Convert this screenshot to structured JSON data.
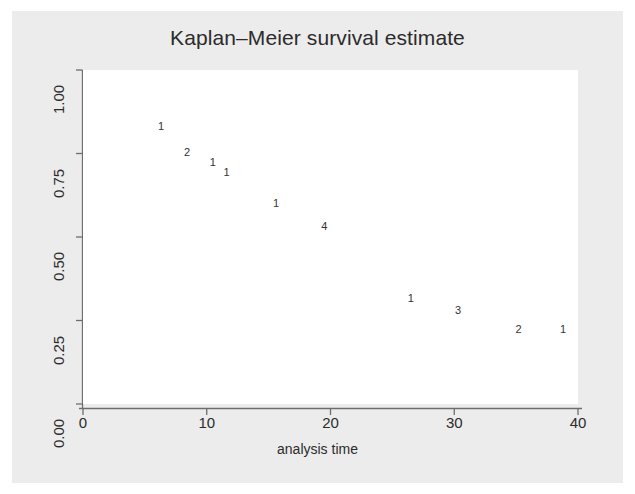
{
  "chart_data": {
    "type": "line",
    "subtype": "step-kaplan-meier",
    "title": "Kaplan–Meier survival estimate",
    "xlabel": "analysis time",
    "ylabel": "",
    "xlim": [
      0,
      40
    ],
    "ylim": [
      0,
      1
    ],
    "grid": "horizontal-faint",
    "legend": "none",
    "line_color": "#555555",
    "x_ticks": [
      "0",
      "10",
      "20",
      "30",
      "40"
    ],
    "x_tick_values": [
      0,
      10,
      20,
      30,
      40
    ],
    "y_ticks": [
      "0.00",
      "0.25",
      "0.50",
      "0.75",
      "1.00"
    ],
    "y_tick_values": [
      0.0,
      0.25,
      0.5,
      0.75,
      1.0
    ],
    "step_points": [
      [
        0,
        1.0
      ],
      [
        1,
        1.0
      ],
      [
        1,
        0.9615
      ],
      [
        2,
        0.9615
      ],
      [
        2,
        0.9231
      ],
      [
        3,
        0.9231
      ],
      [
        3,
        0.8846
      ],
      [
        4,
        0.8846
      ],
      [
        4,
        0.8462
      ],
      [
        5,
        0.8462
      ],
      [
        5,
        0.8077
      ],
      [
        6,
        0.8077
      ],
      [
        6,
        0.7692
      ],
      [
        7,
        0.7692
      ],
      [
        7,
        0.7308
      ],
      [
        8,
        0.7308
      ],
      [
        8,
        0.7013
      ],
      [
        10,
        0.7013
      ],
      [
        10,
        0.6705
      ],
      [
        11,
        0.6705
      ],
      [
        11,
        0.6397
      ],
      [
        12,
        0.6397
      ],
      [
        12,
        0.6089
      ],
      [
        13,
        0.6089
      ],
      [
        13,
        0.5781
      ],
      [
        15,
        0.5781
      ],
      [
        15,
        0.5435
      ],
      [
        16,
        0.5435
      ],
      [
        16,
        0.5089
      ],
      [
        17,
        0.5089
      ],
      [
        17,
        0.4891
      ],
      [
        22,
        0.4891
      ],
      [
        22,
        0.4272
      ],
      [
        23,
        0.4272
      ],
      [
        23,
        0.3737
      ],
      [
        24,
        0.3737
      ],
      [
        24,
        0.3325
      ],
      [
        25,
        0.3325
      ],
      [
        25,
        0.2937
      ],
      [
        28,
        0.2937
      ],
      [
        28,
        0.2569
      ],
      [
        33,
        0.2569
      ],
      [
        33,
        0.1999
      ],
      [
        39,
        0.1999
      ]
    ],
    "censor_annotations": [
      {
        "label": "1",
        "x": 6.3,
        "y": 0.8077
      },
      {
        "label": "2",
        "x": 8.4,
        "y": 0.7308
      },
      {
        "label": "1",
        "x": 10.5,
        "y": 0.7013
      },
      {
        "label": "1",
        "x": 11.6,
        "y": 0.6705
      },
      {
        "label": "1",
        "x": 15.6,
        "y": 0.5781
      },
      {
        "label": "4",
        "x": 19.5,
        "y": 0.5089
      },
      {
        "label": "1",
        "x": 26.5,
        "y": 0.2937
      },
      {
        "label": "3",
        "x": 30.3,
        "y": 0.2569
      },
      {
        "label": "2",
        "x": 35.2,
        "y": 0.1999
      },
      {
        "label": "1",
        "x": 38.8,
        "y": 0.1999
      }
    ]
  },
  "chart": {
    "title": "Kaplan–Meier survival estimate",
    "xlabel": "analysis time"
  }
}
